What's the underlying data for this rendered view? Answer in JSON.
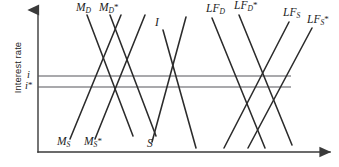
{
  "figure": {
    "type": "line-diagram",
    "title": "",
    "axes": {
      "y_label": "Interest rate",
      "x_label": "",
      "y_axis_x": 38,
      "y_axis_top": 8,
      "y_axis_bottom": 152,
      "x_axis_y": 152,
      "x_axis_left": 38,
      "x_axis_right": 333,
      "arrowheads": [
        "y-top",
        "x-right"
      ]
    },
    "rate_lines": [
      {
        "name": "i",
        "label": "i",
        "y": 76,
        "x_start": 38,
        "x_end": 291
      },
      {
        "name": "i-star",
        "label": "i",
        "star": "*",
        "y": 87,
        "x_start": 38,
        "x_end": 291
      }
    ],
    "curve_labels": [
      {
        "id": "MD",
        "base": "M",
        "sub": "D",
        "star": "",
        "x": 76,
        "y": 2,
        "position": "top"
      },
      {
        "id": "MDs",
        "base": "M",
        "sub": "D",
        "star": "*",
        "x": 99,
        "y": 2,
        "position": "top"
      },
      {
        "id": "I",
        "base": "I",
        "sub": "",
        "star": "",
        "x": 155,
        "y": 17,
        "position": "top"
      },
      {
        "id": "LFD",
        "base": "LF",
        "sub": "D",
        "star": "",
        "x": 206,
        "y": 3,
        "position": "top"
      },
      {
        "id": "LFDs",
        "base": "LF",
        "sub": "D",
        "star": "*",
        "x": 234,
        "y": 0,
        "position": "top"
      },
      {
        "id": "LFS",
        "base": "LF",
        "sub": "S",
        "star": "",
        "x": 283,
        "y": 7,
        "position": "top"
      },
      {
        "id": "LFSs",
        "base": "LF",
        "sub": "S",
        "star": "*",
        "x": 307,
        "y": 14,
        "position": "top"
      },
      {
        "id": "MS",
        "base": "M",
        "sub": "S",
        "star": "",
        "x": 57,
        "y": 136,
        "position": "bottom"
      },
      {
        "id": "MSs",
        "base": "M",
        "sub": "S",
        "star": "*",
        "x": 84,
        "y": 136,
        "position": "bottom"
      },
      {
        "id": "S",
        "base": "S",
        "sub": "",
        "star": "",
        "x": 147,
        "y": 138,
        "position": "bottom"
      }
    ],
    "curves": [
      {
        "id": "MD",
        "slope": "down",
        "x1": 87,
        "y1": 15,
        "x2": 133,
        "y2": 136
      },
      {
        "id": "MDs",
        "slope": "down",
        "x1": 110,
        "y1": 15,
        "x2": 156,
        "y2": 136
      },
      {
        "id": "MS",
        "slope": "up",
        "x1": 70,
        "y1": 139,
        "x2": 121,
        "y2": 15
      },
      {
        "id": "MSs",
        "slope": "up",
        "x1": 95,
        "y1": 139,
        "x2": 145,
        "y2": 15
      },
      {
        "id": "I",
        "slope": "down",
        "x1": 163,
        "y1": 30,
        "x2": 196,
        "y2": 148
      },
      {
        "id": "S",
        "slope": "up",
        "x1": 152,
        "y1": 142,
        "x2": 186,
        "y2": 17
      },
      {
        "id": "LFD",
        "slope": "down",
        "x1": 212,
        "y1": 18,
        "x2": 265,
        "y2": 148
      },
      {
        "id": "LFDs",
        "slope": "down",
        "x1": 239,
        "y1": 15,
        "x2": 292,
        "y2": 145
      },
      {
        "id": "LFS",
        "slope": "up",
        "x1": 224,
        "y1": 148,
        "x2": 289,
        "y2": 22
      },
      {
        "id": "LFSs",
        "slope": "up",
        "x1": 248,
        "y1": 148,
        "x2": 312,
        "y2": 28
      }
    ],
    "colors": {
      "curve": "#2b2b2b",
      "axis": "#3a3a3a",
      "rate_line": "#55555a",
      "background": "#ffffff"
    }
  }
}
